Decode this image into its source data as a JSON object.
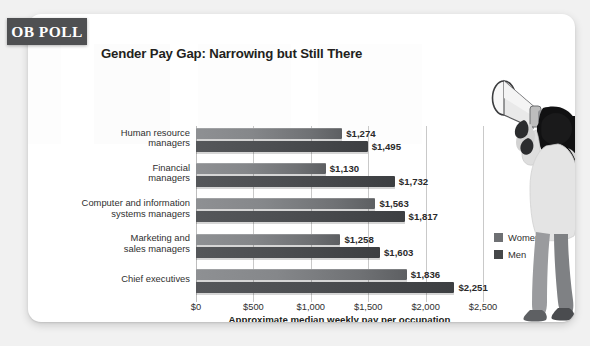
{
  "badge": {
    "label": "OB POLL"
  },
  "header": {
    "title": "Gender Pay Gap: Narrowing but Still There"
  },
  "legend": {
    "position": "right-middle",
    "items": [
      {
        "label": "Women",
        "color": "#6e7073",
        "icon": "square-swatch-icon"
      },
      {
        "label": "Men",
        "color": "#454749",
        "icon": "square-swatch-icon"
      }
    ]
  },
  "illustration": {
    "name": "woman-with-megaphone-illustration"
  },
  "chart_data": {
    "type": "bar",
    "orientation": "horizontal",
    "title": "Gender Pay Gap: Narrowing but Still There",
    "xlabel": "Approximate median weekly pay per occupation",
    "ylabel": "",
    "xlim": [
      0,
      2500
    ],
    "xticks": [
      0,
      500,
      1000,
      1500,
      2000,
      2500
    ],
    "xtick_labels": [
      "$0",
      "$500",
      "$1,000",
      "$1,500",
      "$2,000",
      "$2,500"
    ],
    "grid": true,
    "grid_axis": "x",
    "legend_position": "right",
    "categories": [
      "Human resource managers",
      "Financial managers",
      "Computer and information systems managers",
      "Marketing and sales managers",
      "Chief executives"
    ],
    "category_lines": [
      [
        "Human resource",
        "managers"
      ],
      [
        "Financial",
        "managers"
      ],
      [
        "Computer and information",
        "systems managers"
      ],
      [
        "Marketing and",
        "sales managers"
      ],
      [
        "Chief executives"
      ]
    ],
    "series": [
      {
        "name": "Women",
        "color": "#6e7073",
        "values": [
          1274,
          1130,
          1563,
          1258,
          1836
        ],
        "labels": [
          "$1,274",
          "$1,130",
          "$1,563",
          "$1,258",
          "$1,836"
        ]
      },
      {
        "name": "Men",
        "color": "#454749",
        "values": [
          1495,
          1732,
          1817,
          1603,
          2251
        ],
        "labels": [
          "$1,495",
          "$1,732",
          "$1,817",
          "$1,603",
          "$2,251"
        ]
      }
    ]
  }
}
